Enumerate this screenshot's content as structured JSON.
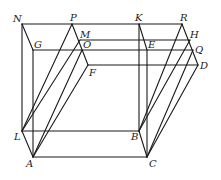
{
  "diagram": {
    "title": "",
    "type": "geometric-figure",
    "points": {
      "N": {
        "label": "N",
        "x": 22,
        "y": 24
      },
      "P": {
        "label": "P",
        "x": 72,
        "y": 24
      },
      "K": {
        "label": "K",
        "x": 139,
        "y": 24
      },
      "R": {
        "label": "R",
        "x": 182,
        "y": 24
      },
      "M": {
        "label": "M",
        "x": 80,
        "y": 40
      },
      "H": {
        "label": "H",
        "x": 190,
        "y": 40
      },
      "G": {
        "label": "G",
        "x": 33,
        "y": 50
      },
      "O": {
        "label": "O",
        "x": 82,
        "y": 50
      },
      "E": {
        "label": "E",
        "x": 147,
        "y": 50
      },
      "Q": {
        "label": "Q",
        "x": 193,
        "y": 50
      },
      "F": {
        "label": "F",
        "x": 88,
        "y": 65
      },
      "D": {
        "label": "D",
        "x": 198,
        "y": 65
      },
      "L": {
        "label": "L",
        "x": 22,
        "y": 131
      },
      "B": {
        "label": "B",
        "x": 139,
        "y": 131
      },
      "A": {
        "label": "A",
        "x": 33,
        "y": 157
      },
      "C": {
        "label": "C",
        "x": 147,
        "y": 157
      }
    },
    "labels": {
      "N": "N",
      "P": "P",
      "K": "K",
      "R": "R",
      "M": "M",
      "H": "H",
      "G": "G",
      "O": "O",
      "E": "E",
      "Q": "Q",
      "F": "F",
      "D": "D",
      "L": "L",
      "B": "B",
      "A": "A",
      "C": "C"
    }
  }
}
